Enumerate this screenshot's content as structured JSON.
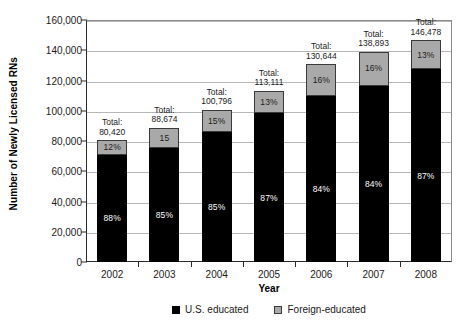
{
  "chart_data": {
    "type": "bar",
    "subtype": "stacked-bar-percent-labeled",
    "title": "",
    "xlabel": "Year",
    "ylabel": "Number of Newly Licensed RNs",
    "categories": [
      "2002",
      "2003",
      "2004",
      "2005",
      "2006",
      "2007",
      "2008"
    ],
    "ylim": [
      0,
      160000
    ],
    "ytick_values": [
      0,
      20000,
      40000,
      60000,
      80000,
      100000,
      120000,
      140000,
      160000
    ],
    "ytick_labels": [
      "0",
      "20,000",
      "40,000",
      "60,000",
      "80,000",
      "100,000",
      "120,000",
      "140,000",
      "160,000"
    ],
    "grid": true,
    "grid_axis": "y",
    "legend_position": "bottom-center",
    "totals": [
      80420,
      88674,
      100796,
      113111,
      130644,
      138893,
      146478
    ],
    "total_labels": [
      {
        "line1": "Total:",
        "line2": "80,420"
      },
      {
        "line1": "Total:",
        "line2": "88,674"
      },
      {
        "line1": "Total:",
        "line2": "100,796"
      },
      {
        "line1": "Total:",
        "line2": "113,111"
      },
      {
        "line1": "Total:",
        "line2": "130,644"
      },
      {
        "line1": "Total:",
        "line2": "138,893"
      },
      {
        "line1": "Total:",
        "line2": "146,478"
      }
    ],
    "series": [
      {
        "name": "U.S. educated",
        "color": "#000000",
        "share_pct": [
          88,
          85,
          85,
          87,
          84,
          84,
          87
        ],
        "data_labels": [
          "88%",
          "85%",
          "85%",
          "87%",
          "84%",
          "84%",
          "87%"
        ],
        "values": [
          70770,
          75373,
          85677,
          98407,
          109741,
          116670,
          127436
        ]
      },
      {
        "name": "Foreign-educated",
        "color": "#a9a9a9",
        "share_pct": [
          12,
          15,
          15,
          13,
          16,
          16,
          13
        ],
        "data_labels": [
          "12%",
          "15",
          "15%",
          "13%",
          "16%",
          "16%",
          "13%"
        ],
        "values": [
          9650,
          13301,
          15119,
          14704,
          20903,
          22223,
          19042
        ]
      }
    ]
  },
  "legend": {
    "items": [
      {
        "label": "U.S. educated",
        "swatch": "black-square"
      },
      {
        "label": "Foreign-educated",
        "swatch": "gray-square"
      }
    ]
  },
  "colors": {
    "us_educated": "#000000",
    "foreign_educated": "#a9a9a9",
    "gridline": "#b6b6b6",
    "axis": "#2b2b2b",
    "text": "#1a1a1a",
    "background": "#ffffff"
  }
}
